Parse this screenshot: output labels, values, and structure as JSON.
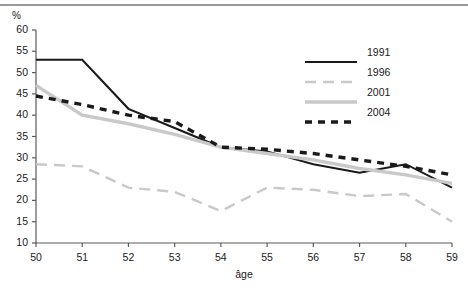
{
  "chart_data": {
    "type": "line",
    "title": "",
    "subtitle": "",
    "xlabel": "âge",
    "ylabel": "%",
    "unit_label": "%",
    "x": [
      50,
      51,
      52,
      53,
      54,
      55,
      56,
      57,
      58,
      59
    ],
    "categories": [
      "50",
      "51",
      "52",
      "53",
      "54",
      "55",
      "56",
      "57",
      "58",
      "59"
    ],
    "xlim": [
      50,
      59
    ],
    "ylim": [
      10,
      60
    ],
    "yticks": [
      10,
      15,
      20,
      25,
      30,
      35,
      40,
      45,
      50,
      55,
      60
    ],
    "ytick_labels": [
      "10",
      "15",
      "20",
      "25",
      "30",
      "35",
      "40",
      "45",
      "50",
      "55",
      "60"
    ],
    "grid": false,
    "legend_position": "top-right",
    "series": [
      {
        "name": "1991",
        "color": "#1a1a1a",
        "style": "solid",
        "values": [
          53.0,
          53.0,
          41.5,
          37.0,
          32.5,
          31.5,
          28.5,
          26.5,
          28.5,
          23.0
        ]
      },
      {
        "name": "1996",
        "color": "#c9c9c9",
        "style": "dashed",
        "values": [
          28.5,
          28.0,
          23.0,
          22.0,
          17.5,
          23.0,
          22.5,
          21.0,
          21.5,
          15.0
        ]
      },
      {
        "name": "2001",
        "color": "#c9c9c9",
        "style": "solid",
        "values": [
          47.0,
          40.0,
          38.0,
          35.5,
          32.5,
          31.0,
          29.5,
          27.5,
          26.0,
          24.0
        ]
      },
      {
        "name": "2004",
        "color": "#1a1a1a",
        "style": "dotted",
        "values": [
          44.5,
          42.5,
          40.0,
          38.5,
          32.5,
          32.0,
          31.0,
          29.5,
          28.0,
          26.0
        ]
      }
    ]
  },
  "legend": {
    "entries": [
      {
        "label": "1991"
      },
      {
        "label": "1996"
      },
      {
        "label": "2001"
      },
      {
        "label": "2004"
      }
    ]
  },
  "axes": {
    "x_title": "âge",
    "y_unit": "%"
  },
  "colors": {
    "dark": "#1a1a1a",
    "light": "#c9c9c9",
    "axis": "#5a5a5a",
    "rule": "#9a9a9a"
  }
}
